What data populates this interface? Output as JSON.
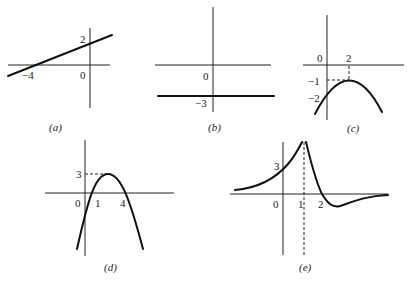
{
  "figure": {
    "panels": [
      {
        "id": "a",
        "label": "(a)",
        "type": "line",
        "ticks": {
          "x_intercept": "−4",
          "y_intercept": "2",
          "origin": "0"
        },
        "points": {
          "x_intercept": [
            -4,
            0
          ],
          "y_intercept": [
            0,
            2
          ]
        }
      },
      {
        "id": "b",
        "label": "(b)",
        "type": "horizontal-line",
        "ticks": {
          "origin": "0",
          "y_value": "−3"
        },
        "y_value": -3
      },
      {
        "id": "c",
        "label": "(c)",
        "type": "parabola-down",
        "ticks": {
          "origin": "0",
          "vertex_x": "2",
          "vertex_y": "−1",
          "y_intercept": "−2"
        },
        "vertex": [
          2,
          -1
        ],
        "y_intercept": -2
      },
      {
        "id": "d",
        "label": "(d)",
        "type": "parabola-down",
        "ticks": {
          "origin": "0",
          "root1": "1",
          "root2": "4",
          "max_y": "3"
        },
        "roots": [
          1,
          4
        ],
        "max_y": 3
      },
      {
        "id": "e",
        "label": "(e)",
        "type": "rational-with-asymptote",
        "ticks": {
          "origin": "0",
          "asymptote_x": "1",
          "x_intercept": "2",
          "y_intercept": "3"
        },
        "vertical_asymptote": 1,
        "x_intercept": 2,
        "y_intercept": 3,
        "horizontal_asymptote": 0
      }
    ]
  }
}
